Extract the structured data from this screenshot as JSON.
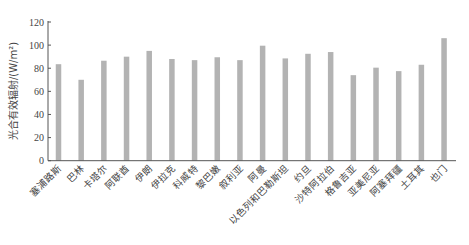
{
  "chart_data": {
    "type": "bar",
    "title": "",
    "xlabel": "",
    "ylabel": "光合有效辐射/(W/m²)",
    "ylim": [
      0,
      120
    ],
    "yticks": [
      0,
      20,
      40,
      60,
      80,
      100,
      120
    ],
    "grid": false,
    "legend": null,
    "bar_color": "#b3b3b3",
    "categories": [
      "塞浦路斯",
      "巴林",
      "卡塔尔",
      "阿联酋",
      "伊朗",
      "伊拉克",
      "科威特",
      "黎巴嫩",
      "叙利亚",
      "阿曼",
      "以色列和巴勒斯坦",
      "约旦",
      "沙特阿拉伯",
      "格鲁吉亚",
      "亚美尼亚",
      "阿塞拜疆",
      "土耳其",
      "也门"
    ],
    "values": [
      83.5,
      70,
      86.5,
      90,
      95,
      88,
      87,
      89.5,
      87,
      99.5,
      88.5,
      92.5,
      94,
      74,
      80.5,
      77.5,
      83,
      106
    ]
  }
}
